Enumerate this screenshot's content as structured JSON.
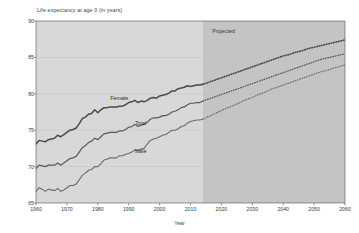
{
  "chart_data": {
    "type": "line",
    "title": "Life expectancy at age 0  (in years)",
    "xlabel": "Year",
    "ylabel": "Life expectancy at age 0  (in years)",
    "xlim": [
      1960,
      2060
    ],
    "ylim": [
      65,
      90
    ],
    "xticks": [
      1960,
      1970,
      1980,
      1990,
      2000,
      2010,
      2020,
      2030,
      2040,
      2050,
      2060
    ],
    "yticks": [
      65,
      70,
      75,
      80,
      85,
      90
    ],
    "grid": true,
    "legend_position": "inline-labels",
    "annotations": [
      {
        "text": "Projected",
        "x": 2017,
        "y": 88.6
      },
      {
        "text": "Female",
        "x": 1984,
        "y": 79.4
      },
      {
        "text": "Total",
        "x": 1992,
        "y": 75.9
      },
      {
        "text": "Male",
        "x": 1992,
        "y": 72.1
      }
    ],
    "projection_start_year": 2014,
    "colors": {
      "female_line": "#4a4a4a",
      "total_line": "#5a5a5a",
      "male_line": "#6a6a6a",
      "historical_bg": "#d8d8d8",
      "projected_bg": "#c4c4c4",
      "gridline": "#c0c0c0",
      "axis": "#555555",
      "text": "#3c3c3c"
    },
    "x": [
      1960,
      1961,
      1962,
      1963,
      1964,
      1965,
      1966,
      1967,
      1968,
      1969,
      1970,
      1971,
      1972,
      1973,
      1974,
      1975,
      1976,
      1977,
      1978,
      1979,
      1980,
      1981,
      1982,
      1983,
      1984,
      1985,
      1986,
      1987,
      1988,
      1989,
      1990,
      1991,
      1992,
      1993,
      1994,
      1995,
      1996,
      1997,
      1998,
      1999,
      2000,
      2001,
      2002,
      2003,
      2004,
      2005,
      2006,
      2007,
      2008,
      2009,
      2010,
      2011,
      2012,
      2013,
      2014
    ],
    "x_projected": [
      2014,
      2016,
      2018,
      2020,
      2022,
      2024,
      2026,
      2028,
      2030,
      2032,
      2034,
      2036,
      2038,
      2040,
      2042,
      2044,
      2046,
      2048,
      2050,
      2052,
      2054,
      2056,
      2058,
      2060
    ],
    "series": [
      {
        "name": "Female",
        "style": "solid-then-dotted",
        "values": [
          73.1,
          73.6,
          73.5,
          73.4,
          73.7,
          73.8,
          73.9,
          74.3,
          74.1,
          74.4,
          74.7,
          75.0,
          75.1,
          75.3,
          75.9,
          76.6,
          76.8,
          77.2,
          77.3,
          77.8,
          77.4,
          77.8,
          78.1,
          78.1,
          78.2,
          78.2,
          78.2,
          78.3,
          78.3,
          78.5,
          78.8,
          78.9,
          79.1,
          78.8,
          79.0,
          78.9,
          79.1,
          79.4,
          79.5,
          79.4,
          79.7,
          79.8,
          79.9,
          80.1,
          80.4,
          80.4,
          80.7,
          80.8,
          80.9,
          81.1,
          81.0,
          81.1,
          81.2,
          81.2,
          81.3
        ],
        "values_projected": [
          81.3,
          81.6,
          81.9,
          82.2,
          82.5,
          82.8,
          83.1,
          83.4,
          83.7,
          84.0,
          84.3,
          84.6,
          84.9,
          85.2,
          85.4,
          85.7,
          85.9,
          86.2,
          86.4,
          86.6,
          86.8,
          87.0,
          87.2,
          87.4
        ]
      },
      {
        "name": "Total",
        "style": "solid-then-dotted",
        "values": [
          69.7,
          70.2,
          70.1,
          70.0,
          70.2,
          70.2,
          70.2,
          70.5,
          70.2,
          70.5,
          70.8,
          71.1,
          71.2,
          71.4,
          72.0,
          72.6,
          72.9,
          73.3,
          73.5,
          73.9,
          73.7,
          74.1,
          74.5,
          74.6,
          74.7,
          74.7,
          74.7,
          74.9,
          74.9,
          75.1,
          75.4,
          75.5,
          75.8,
          75.5,
          75.7,
          75.8,
          76.1,
          76.5,
          76.7,
          76.7,
          76.8,
          77.0,
          77.0,
          77.2,
          77.5,
          77.6,
          77.8,
          78.1,
          78.2,
          78.5,
          78.7,
          78.7,
          78.8,
          78.8,
          79.0
        ],
        "values_projected": [
          79.0,
          79.3,
          79.6,
          79.9,
          80.2,
          80.5,
          80.8,
          81.1,
          81.4,
          81.7,
          82.0,
          82.3,
          82.6,
          82.9,
          83.2,
          83.5,
          83.8,
          84.1,
          84.4,
          84.7,
          84.9,
          85.1,
          85.3,
          85.5
        ]
      },
      {
        "name": "Male",
        "style": "solid-then-dotted",
        "values": [
          66.6,
          67.1,
          66.9,
          66.6,
          66.9,
          66.8,
          66.7,
          67.0,
          66.6,
          66.8,
          67.1,
          67.4,
          67.4,
          67.6,
          68.2,
          68.8,
          69.1,
          69.5,
          69.6,
          70.0,
          70.0,
          70.4,
          70.9,
          71.0,
          71.2,
          71.2,
          71.2,
          71.5,
          71.5,
          71.7,
          71.8,
          72.0,
          72.3,
          72.2,
          72.4,
          72.5,
          73.1,
          73.6,
          73.8,
          73.9,
          74.1,
          74.3,
          74.4,
          74.7,
          75.0,
          75.0,
          75.2,
          75.5,
          75.6,
          76.0,
          76.2,
          76.3,
          76.4,
          76.4,
          76.5
        ],
        "values_projected": [
          76.5,
          76.9,
          77.3,
          77.7,
          78.1,
          78.4,
          78.8,
          79.2,
          79.5,
          79.9,
          80.2,
          80.6,
          80.9,
          81.2,
          81.5,
          81.8,
          82.1,
          82.4,
          82.7,
          83.0,
          83.2,
          83.5,
          83.7,
          84.0
        ]
      }
    ]
  }
}
